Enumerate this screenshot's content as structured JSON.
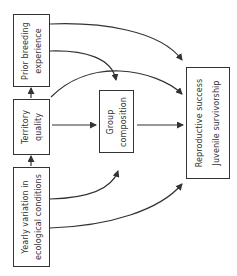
{
  "diagram": {
    "orientation": "rotated-90-ccw",
    "nodes": [
      {
        "id": "prior",
        "lines": [
          "Prior breeding",
          "experience"
        ]
      },
      {
        "id": "territory",
        "lines": [
          "Territory",
          "quality"
        ]
      },
      {
        "id": "yearly",
        "lines": [
          "Yearly variation in",
          "ecological conditions"
        ]
      },
      {
        "id": "group",
        "lines": [
          "Group",
          "composition"
        ]
      },
      {
        "id": "repro",
        "lines": [
          "Reproductive success",
          "Juvenile survivorship"
        ]
      }
    ],
    "edges": [
      {
        "from": "territory",
        "to": "prior"
      },
      {
        "from": "yearly",
        "to": "territory"
      },
      {
        "from": "territory",
        "to": "group"
      },
      {
        "from": "group",
        "to": "repro"
      },
      {
        "from": "prior",
        "to": "repro"
      },
      {
        "from": "prior",
        "to": "group"
      },
      {
        "from": "territory",
        "to": "repro"
      },
      {
        "from": "yearly",
        "to": "group"
      },
      {
        "from": "yearly",
        "to": "repro"
      }
    ],
    "line_color": "#333333"
  }
}
